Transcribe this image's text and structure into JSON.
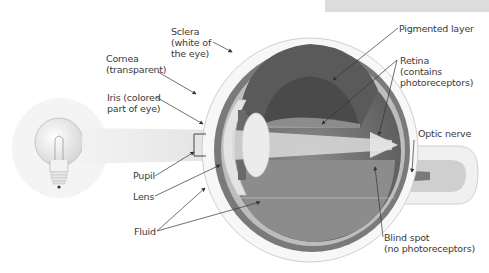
{
  "diagram": {
    "type": "anatomical-illustration",
    "labels": {
      "sclera": [
        "Sclera",
        "(white of",
        "the eye)"
      ],
      "cornea": [
        "Cornea",
        "(transparent)"
      ],
      "iris": [
        "Iris (colored",
        "part of eye)"
      ],
      "pupil": [
        "Pupil"
      ],
      "lens": [
        "Lens"
      ],
      "fluid": [
        "Fluid"
      ],
      "pigmented_layer": [
        "Pigmented layer"
      ],
      "retina": [
        "Retina",
        "(contains",
        "photoreceptors)"
      ],
      "optic_nerve": [
        "Optic nerve"
      ],
      "blind_spot": [
        "Blind spot",
        "(no photoreceptors)"
      ]
    },
    "colors": {
      "background": "#ffffff",
      "label_text": "#3a3a3a",
      "leader_line": "#333333",
      "light_beam": "#e6e6e6",
      "eye_interior_dark": "#6e6e6e",
      "eye_interior_mid": "#9a9a9a",
      "sclera_outline": "#cfcfcf",
      "lens_fill": "#e9e9e9",
      "top_box": "#dcdcdc"
    }
  }
}
